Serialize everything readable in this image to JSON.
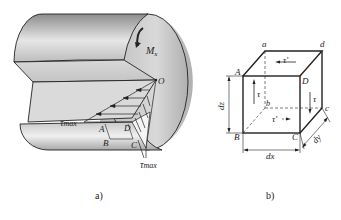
{
  "figure_a": {
    "caption": "a)",
    "moment_label": "M",
    "moment_subscript": "x",
    "center_label": "O",
    "tau_max_top": "τ",
    "tau_max_top_sub": "max",
    "tau_max_bottom": "τ",
    "tau_max_bottom_sub": "max",
    "points": {
      "A": "A",
      "B": "B",
      "C": "C",
      "D": "D"
    }
  },
  "figure_b": {
    "caption": "b)",
    "vertices": {
      "a": "a",
      "d": "d",
      "A": "A",
      "D": "D",
      "b": "b",
      "c": "c",
      "B": "B",
      "C": "C"
    },
    "tau_top": "τ'",
    "tau_left": "τ",
    "tau_right": "τ",
    "tau_bottom": "τ'",
    "dim_z": "dz",
    "dim_x": "dx",
    "dim_y": "dy"
  },
  "colors": {
    "line": "#222222",
    "shade_light": "#e8e8e8",
    "shade_dark": "#9a9a9a"
  }
}
